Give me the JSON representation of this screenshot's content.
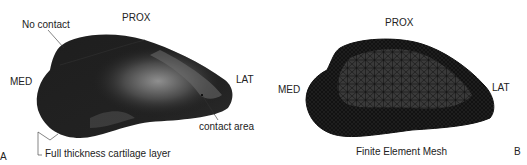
{
  "figure": {
    "panels": [
      {
        "id": "A",
        "panel_letter": "A",
        "orientation": {
          "top": "PROX",
          "left": "MED",
          "right": "LAT"
        },
        "annotations": {
          "no_contact": "No contact",
          "contact_area": "contact area",
          "cartilage": "Full thickness cartilage layer"
        }
      },
      {
        "id": "B",
        "panel_letter": "B",
        "orientation": {
          "top": "PROX",
          "left": "MED",
          "right": "LAT"
        },
        "caption": "Finite Element Mesh"
      }
    ],
    "colors": {
      "surface_dark": "#1c1c1c",
      "surface_highlight": "#8a8a8a",
      "mesh_line": "#0d0d0d",
      "mesh_fill": "#3a3a3a",
      "text": "#222222"
    }
  }
}
